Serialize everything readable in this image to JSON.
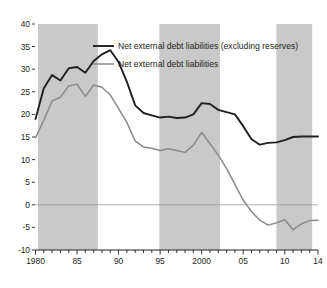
{
  "caption": {
    "clipped_top_line": "net external liabilities to assets and debt to assets has continued to be the domin"
  },
  "chart_data": {
    "type": "line",
    "title": "",
    "subtitle": "",
    "xlabel": "",
    "ylabel": "",
    "xlim": [
      1980,
      2014
    ],
    "ylim": [
      -10,
      40
    ],
    "ytick_values": [
      40,
      35,
      30,
      25,
      20,
      15,
      10,
      5,
      0,
      -5,
      -10
    ],
    "ytick_labels": [
      "40",
      "35",
      "30",
      "25",
      "20",
      "15",
      "10",
      "5",
      "0",
      "-5",
      "-10"
    ],
    "xtick_values": [
      1980,
      1985,
      1990,
      1995,
      2000,
      2005,
      2010,
      2014
    ],
    "xtick_labels": [
      "1980",
      "85",
      "90",
      "95",
      "2000",
      "05",
      "10",
      "14"
    ],
    "x_minor_tick_interval": 1,
    "grid": false,
    "zero_line": true,
    "legend_position": "top-center",
    "shaded_bands": [
      {
        "start": 1980.3,
        "end": 1987.5,
        "color": "#c9c9c9"
      },
      {
        "start": 1994.9,
        "end": 2002.2,
        "color": "#c9c9c9"
      },
      {
        "start": 2009.0,
        "end": 2013.3,
        "color": "#c9c9c9"
      }
    ],
    "x": [
      1980,
      1981,
      1982,
      1983,
      1984,
      1985,
      1986,
      1987,
      1988,
      1989,
      1990,
      1991,
      1992,
      1993,
      1994,
      1995,
      1996,
      1997,
      1998,
      1999,
      2000,
      2001,
      2002,
      2003,
      2004,
      2005,
      2006,
      2007,
      2008,
      2009,
      2010,
      2011,
      2012,
      2013,
      2014
    ],
    "series": [
      {
        "name": "Net external debt liabilities (excluding reserves)",
        "color": "#231f20",
        "width": 1.9,
        "values": [
          19.0,
          25.8,
          28.7,
          27.5,
          30.2,
          30.5,
          29.2,
          31.8,
          33.3,
          34.2,
          31.6,
          27.2,
          22.0,
          20.3,
          19.8,
          19.3,
          19.5,
          19.2,
          19.3,
          20.0,
          22.5,
          22.3,
          21.0,
          20.5,
          20.0,
          17.4,
          14.5,
          13.3,
          13.7,
          13.8,
          14.3,
          15.0,
          15.1,
          15.1,
          15.1
        ]
      },
      {
        "name": "Net external debt liabilities",
        "color": "#8a8a8a",
        "width": 1.5,
        "values": [
          14.8,
          18.7,
          23.0,
          23.8,
          26.3,
          26.7,
          24.0,
          26.5,
          26.0,
          24.3,
          21.3,
          18.2,
          14.1,
          12.8,
          12.5,
          12.0,
          12.4,
          12.0,
          11.6,
          13.2,
          16.0,
          13.5,
          11.0,
          8.0,
          4.5,
          1.0,
          -1.5,
          -3.4,
          -4.5,
          -4.0,
          -3.3,
          -5.5,
          -4.2,
          -3.5,
          -3.4
        ]
      }
    ]
  },
  "legend": {
    "items": [
      {
        "label": "Net external debt liabilities (excluding reserves)",
        "color": "#231f20"
      },
      {
        "label": "Net external debt liabilities",
        "color": "#8a8a8a"
      }
    ]
  }
}
